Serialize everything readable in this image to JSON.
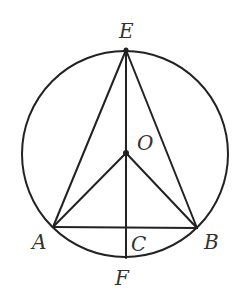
{
  "diagram": {
    "type": "circle-geometry",
    "circle": {
      "center": "O",
      "cx": 125,
      "cy": 154,
      "r": 103
    },
    "points": {
      "E": {
        "x": 126,
        "y": 50,
        "label": "E",
        "lx": 119,
        "ly": 38
      },
      "O": {
        "x": 126,
        "y": 153,
        "label": "O",
        "lx": 137,
        "ly": 150
      },
      "A": {
        "x": 53,
        "y": 227,
        "label": "A",
        "lx": 32,
        "ly": 249
      },
      "B": {
        "x": 197,
        "y": 228,
        "label": "B",
        "lx": 204,
        "ly": 249
      },
      "C": {
        "x": 126,
        "y": 228,
        "label": "C",
        "lx": 131,
        "ly": 251
      },
      "F": {
        "x": 126,
        "y": 258,
        "label": "F",
        "lx": 115,
        "ly": 285
      }
    },
    "segments": [
      [
        "E",
        "A"
      ],
      [
        "E",
        "B"
      ],
      [
        "E",
        "F"
      ],
      [
        "O",
        "A"
      ],
      [
        "O",
        "B"
      ],
      [
        "A",
        "B"
      ]
    ],
    "labels": {
      "E": "E",
      "O": "O",
      "A": "A",
      "B": "B",
      "C": "C",
      "F": "F"
    },
    "colors": {
      "stroke": "#222222",
      "text": "#333333",
      "background": "#ffffff"
    }
  }
}
